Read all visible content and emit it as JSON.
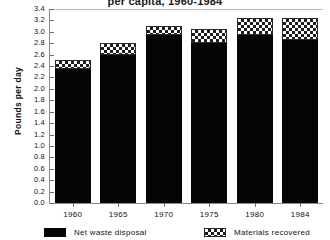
{
  "chart_data": {
    "type": "bar",
    "stacked": true,
    "title": "per capita, 1960-1984",
    "xlabel": "",
    "ylabel": "Pounds per day",
    "categories": [
      "1960",
      "1965",
      "1970",
      "1975",
      "1980",
      "1984"
    ],
    "series": [
      {
        "name": "Net waste disposal",
        "color": "#050505",
        "pattern": "solid",
        "values": [
          2.35,
          2.6,
          2.95,
          2.8,
          2.95,
          2.85
        ]
      },
      {
        "name": "Materials recovered",
        "color": "#1d1d1d",
        "pattern": "checker",
        "values": [
          0.15,
          0.2,
          0.15,
          0.25,
          0.3,
          0.4
        ]
      }
    ],
    "totals": [
      2.5,
      2.8,
      3.1,
      3.05,
      3.25,
      3.25
    ],
    "ylim": [
      0.0,
      3.4
    ],
    "ytick_step": 0.2,
    "ytick_labels": [
      "0.0",
      "0.2",
      "0.4",
      "0.6",
      "0.8",
      "1.0",
      "1.2",
      "1.4",
      "1.6",
      "1.8",
      "2.0",
      "2.2",
      "2.4",
      "2.6",
      "2.8",
      "3.0",
      "3.2",
      "3.4"
    ],
    "grid": false,
    "legend_position": "bottom"
  },
  "legend": {
    "items": [
      {
        "label": "Net waste disposal",
        "swatch": "solid"
      },
      {
        "label": "Materials recovered",
        "swatch": "checker"
      }
    ]
  }
}
